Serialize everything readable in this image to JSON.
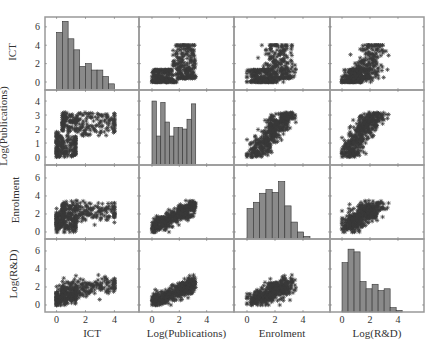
{
  "chart_data": {
    "type": "scatter-matrix",
    "title": "",
    "variables": [
      "ICT",
      "Log(Publications)",
      "Enrolment",
      "Log(R&D)"
    ],
    "x_ticks": {
      "ICT": [
        0,
        2,
        4
      ],
      "Log(Publications)": [
        0,
        2,
        4
      ],
      "Enrolment": [
        0,
        2,
        4
      ],
      "Log(R&D)": [
        0,
        2,
        4
      ]
    },
    "y_ticks": {
      "ICT": [
        0,
        2,
        4,
        6
      ],
      "Log(Publications)": [
        0,
        1,
        2,
        3,
        4
      ],
      "Enrolment": [
        0,
        2,
        4,
        6
      ],
      "Log(R&D)": [
        0,
        2,
        4,
        6
      ]
    },
    "x_ranges": {
      "ICT": [
        -0.8,
        5.7
      ],
      "Log(Publications)": [
        -0.95,
        6.0
      ],
      "Enrolment": [
        -0.93,
        5.93
      ],
      "Log(R&D)": [
        -0.86,
        5.86
      ]
    },
    "y_ranges": {
      "ICT": [
        -0.87,
        7.07
      ],
      "Log(Publications)": [
        -0.57,
        4.79
      ],
      "Enrolment": [
        -0.78,
        7.44
      ],
      "Log(R&D)": [
        -0.78,
        7.33
      ]
    },
    "histograms": {
      "ICT": {
        "bin_start": 0.0,
        "bin_width": 0.4,
        "heights": [
          5.4,
          6.6,
          4.7,
          3.5,
          1.7,
          2.0,
          1.3,
          1.3,
          0.6,
          -0.2
        ]
      },
      "Log(Publications)": {
        "bin_start": 0.0,
        "bin_width": 0.32,
        "heights": [
          4.0,
          1.5,
          3.9,
          2.5,
          1.5,
          2.1,
          2.1,
          2.0,
          2.7,
          3.8
        ]
      },
      "Enrolment": {
        "bin_start": 0.0,
        "bin_width": 0.45,
        "heights": [
          2.6,
          3.3,
          4.3,
          4.7,
          4.4,
          5.6,
          2.9,
          1.1,
          0.0,
          -0.5
        ]
      },
      "Log(R&D)": {
        "bin_start": 0.0,
        "bin_width": 0.43,
        "heights": [
          4.7,
          6.2,
          5.9,
          2.6,
          1.8,
          2.3,
          1.6,
          1.8,
          -0.3,
          -0.6
        ]
      }
    },
    "hist_y_scale_row": {
      "ICT": "ICT",
      "Log(Publications)": "Log(Publications)",
      "Enrolment": "Enrolment",
      "Log(R&D)": "Log(R&D)"
    },
    "scatter_marker": "asterisk",
    "marker_color": "#3a3a3a",
    "bar_color": "#8a8a8a",
    "grid": false,
    "legend": null
  }
}
